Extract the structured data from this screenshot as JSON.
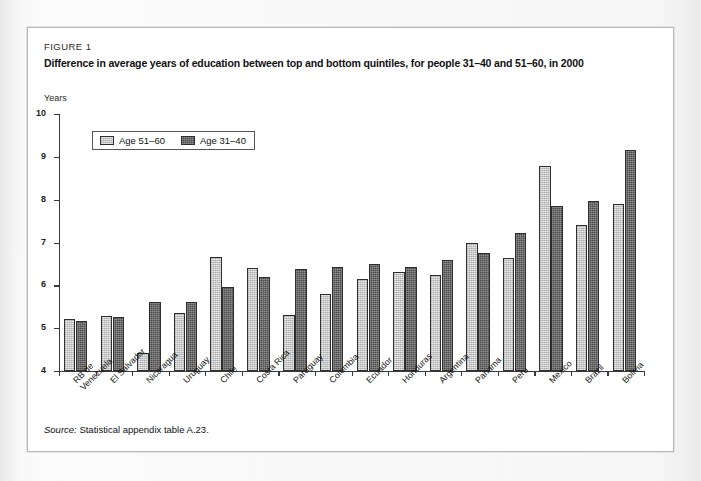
{
  "figure": {
    "label": "FIGURE 1",
    "title": "Difference in average years of education between top and bottom quintiles, for people 31–40 and 51–60, in 2000",
    "source_word": "Source:",
    "source_text": "Statistical appendix table A.23."
  },
  "legend": {
    "items": [
      {
        "label": "Age 51–60",
        "color": "#c6c6c6",
        "style": "light"
      },
      {
        "label": "Age 31–40",
        "color": "#4c4c4c",
        "style": "dark"
      }
    ]
  },
  "chart_data": {
    "type": "bar",
    "title": "Difference in average years of education between top and bottom quintiles, for people 31–40 and 51–60, in 2000",
    "xlabel": "",
    "ylabel": "Years",
    "ylim": [
      4,
      10
    ],
    "yticks": [
      4,
      5,
      6,
      7,
      8,
      9,
      10
    ],
    "ytick_labels": [
      "4",
      "5",
      "6",
      "7",
      "8",
      "9",
      "10"
    ],
    "grid": false,
    "legend_position": "top-left",
    "categories": [
      "RB de Venezuela",
      "El Salvador",
      "Nicaragua",
      "Uruguay",
      "Chile",
      "Costa Rica",
      "Paraguay",
      "Colombia",
      "Ecuador",
      "Honduras",
      "Argentina",
      "Panama",
      "Peru",
      "Mexico",
      "Brazil",
      "Bolivia"
    ],
    "series": [
      {
        "name": "Age 51–60",
        "color": "#c6c6c6",
        "values": [
          5.22,
          5.28,
          4.42,
          5.35,
          6.67,
          6.4,
          5.3,
          5.8,
          6.15,
          6.3,
          6.24,
          7.0,
          6.65,
          8.78,
          7.4,
          7.9
        ]
      },
      {
        "name": "Age 31–40",
        "color": "#4c4c4c",
        "values": [
          5.17,
          5.25,
          5.6,
          5.6,
          5.96,
          6.2,
          6.38,
          6.44,
          6.5,
          6.42,
          6.6,
          6.75,
          7.23,
          7.86,
          7.97,
          9.15
        ]
      }
    ]
  },
  "colors": {
    "page_background": "#f2f2f2",
    "figure_background": "#ffffff",
    "figure_border": "#b9b9b9",
    "axis": "#3a3a3a",
    "text": "#111111"
  }
}
